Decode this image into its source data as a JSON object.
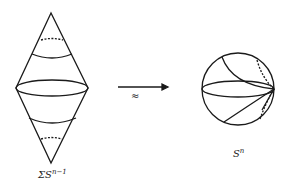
{
  "left_label": {
    "prefix": "ΣS",
    "sup": "n−1"
  },
  "right_label": {
    "base": "S",
    "sup": "n"
  },
  "arrow_label": "≈",
  "stroke_color": "#1a1a1a"
}
